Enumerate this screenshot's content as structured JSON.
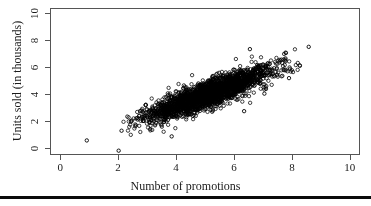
{
  "chart_data": {
    "type": "scatter",
    "title": "",
    "xlabel": "Number of promotions",
    "ylabel": "Units sold (in thousands)",
    "xlim": [
      -0.35,
      10.35
    ],
    "ylim": [
      -0.5,
      10.4
    ],
    "xticks": [
      0,
      2,
      4,
      6,
      8,
      10
    ],
    "xticklabels": [
      "0",
      "2",
      "4",
      "6",
      "8",
      "10"
    ],
    "yticks": [
      0,
      2,
      4,
      6,
      8,
      10
    ],
    "yticklabels": [
      "0",
      "2",
      "4",
      "6",
      "8",
      "10"
    ],
    "grid": false,
    "legend": false,
    "marker": "open-circle",
    "marker_color": "#000000",
    "marker_size_px": 3.4,
    "frame_color": "#555555",
    "background_color": "#ffffff",
    "n_points": 2600,
    "cluster": {
      "x_mean": 5.15,
      "y_mean": 4.05,
      "x_sd": 1.05,
      "y_sd": 0.95,
      "correlation": 0.86,
      "x_range": [
        2.1,
        8.4
      ],
      "y_range": [
        0.85,
        7.4
      ]
    },
    "outliers": [
      {
        "x": 0.92,
        "y": 0.58
      },
      {
        "x": 2.02,
        "y": -0.18
      },
      {
        "x": 2.12,
        "y": 1.3
      },
      {
        "x": 3.85,
        "y": 0.88
      },
      {
        "x": 6.55,
        "y": 7.35
      },
      {
        "x": 8.58,
        "y": 7.52
      },
      {
        "x": 7.9,
        "y": 5.2
      },
      {
        "x": 6.35,
        "y": 2.75
      },
      {
        "x": 7.05,
        "y": 4.05
      }
    ]
  },
  "axis_titles": {
    "x": "Number of promotions",
    "y": "Units sold (in thousands)"
  }
}
